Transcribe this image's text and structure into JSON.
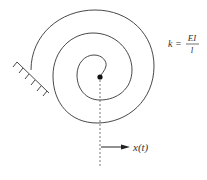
{
  "diagram": {
    "stiffness": {
      "lhs": "k =",
      "numerator": "EI",
      "denominator": "l"
    },
    "displacement_label": "x(t)",
    "colors": {
      "stroke": "#333333",
      "background": "#ffffff"
    }
  }
}
